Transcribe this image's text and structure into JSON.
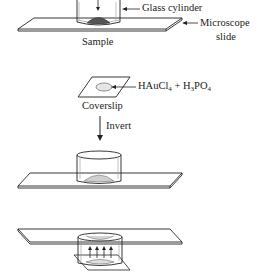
{
  "diagram": {
    "step1": {
      "labels": {
        "cylinder": "Glass cylinder",
        "slide_line1": "Microscope",
        "slide_line2": "slide",
        "sample": "Sample"
      }
    },
    "step2": {
      "labels": {
        "reagent_main": "HAuCl",
        "reagent_sub1": "4",
        "reagent_plus": " + H",
        "reagent_sub2": "3",
        "reagent_po": "PO",
        "reagent_sub3": "4",
        "coverslip": "Coverslip"
      }
    },
    "step3": {
      "labels": {
        "invert": "Invert"
      }
    },
    "colors": {
      "line": "#222222",
      "sample_fill": "#555555",
      "droplet_fill": "#cfcfcf",
      "ellipse_fill": "#e6e6e6"
    }
  }
}
